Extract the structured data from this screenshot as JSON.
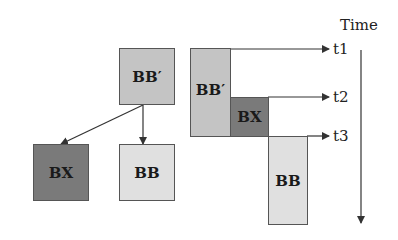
{
  "tree": {
    "root": {
      "label": "BB′",
      "color": "#c4c4c4"
    },
    "children": [
      {
        "label": "BX",
        "color": "#7a7a7a"
      },
      {
        "label": "BB",
        "color": "#e0e0e0"
      }
    ]
  },
  "timeline": {
    "axis_label": "Time",
    "blocks": [
      {
        "label": "BB′",
        "color": "#c4c4c4"
      },
      {
        "label": "BX",
        "color": "#7a7a7a"
      },
      {
        "label": "BB",
        "color": "#e0e0e0"
      }
    ],
    "markers": [
      "t1",
      "t2",
      "t3"
    ]
  }
}
